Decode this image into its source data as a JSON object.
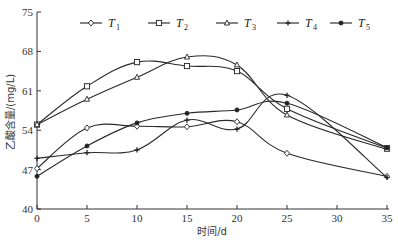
{
  "chart_data": {
    "type": "line",
    "title": "",
    "xlabel": "时间/d",
    "ylabel": "乙酸含量/(mg/L)",
    "x": [
      0,
      5,
      10,
      15,
      20,
      25,
      35
    ],
    "xticks": [
      0,
      5,
      10,
      15,
      20,
      25,
      30,
      35
    ],
    "yticks": [
      40,
      47,
      54,
      61,
      68,
      75
    ],
    "xlim": [
      0,
      35
    ],
    "ylim": [
      40,
      75
    ],
    "grid": false,
    "legend_position": "top-inside",
    "series": [
      {
        "name": "T1",
        "marker": "diamond-open",
        "values": [
          47.2,
          54.4,
          54.7,
          54.6,
          55.5,
          49.9,
          45.8
        ]
      },
      {
        "name": "T2",
        "marker": "square-open",
        "values": [
          55.0,
          61.8,
          66.1,
          65.4,
          64.5,
          57.8,
          50.8
        ]
      },
      {
        "name": "T3",
        "marker": "triangle-open",
        "values": [
          55.0,
          59.5,
          63.4,
          67.0,
          65.6,
          56.7,
          50.6
        ]
      },
      {
        "name": "T4",
        "marker": "cross",
        "values": [
          49.0,
          50.0,
          50.5,
          55.8,
          54.2,
          60.2,
          45.6
        ]
      },
      {
        "name": "T5",
        "marker": "dot-filled",
        "values": [
          45.8,
          51.2,
          55.3,
          57.0,
          57.6,
          58.8,
          50.9
        ]
      }
    ]
  },
  "legend": {
    "items": [
      {
        "letter": "T",
        "sub": "1"
      },
      {
        "letter": "T",
        "sub": "2"
      },
      {
        "letter": "T",
        "sub": "3"
      },
      {
        "letter": "T",
        "sub": "4"
      },
      {
        "letter": "T",
        "sub": "5"
      }
    ]
  },
  "axes": {
    "xlabel": "时间/d",
    "ylabel": "乙酸含量/(mg/L)"
  }
}
